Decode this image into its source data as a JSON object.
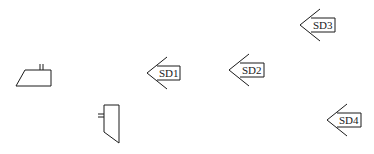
{
  "diagram": {
    "background": "#ffffff",
    "line_color": "#1a1a1a",
    "symbols": [
      {
        "id": "shape-trapezoid-horizontal",
        "type": "trapezoid-with-ticks"
      },
      {
        "id": "shape-trapezoid-vertical",
        "type": "trapezoid-with-ticks"
      }
    ],
    "arrows": [
      {
        "id": "sd1",
        "label": "SD1"
      },
      {
        "id": "sd2",
        "label": "SD2"
      },
      {
        "id": "sd3",
        "label": "SD3"
      },
      {
        "id": "sd4",
        "label": "SD4"
      }
    ]
  }
}
